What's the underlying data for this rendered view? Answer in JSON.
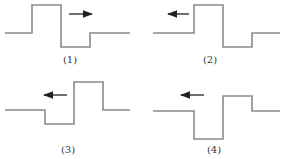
{
  "panels": [
    {
      "label": "(1)",
      "direction": "right",
      "waveform": "pulse-up-then-down"
    },
    {
      "label": "(2)",
      "direction": "left",
      "waveform": "pulse-up-then-down"
    },
    {
      "label": "(3)",
      "direction": "left",
      "waveform": "pulse-down-then-up"
    },
    {
      "label": "(4)",
      "direction": "left",
      "waveform": "deep-down-then-up"
    }
  ],
  "colors": {
    "wave": "#8a8a8a",
    "arrow": "#222222",
    "text": "#333333"
  }
}
